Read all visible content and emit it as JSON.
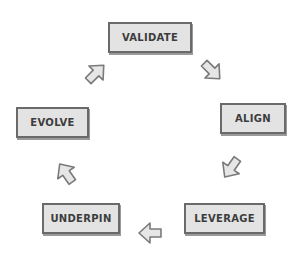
{
  "diagram": {
    "type": "cycle",
    "nodes": [
      {
        "id": "validate",
        "label": "VALIDATE"
      },
      {
        "id": "align",
        "label": "ALIGN"
      },
      {
        "id": "leverage",
        "label": "LEVERAGE"
      },
      {
        "id": "underpin",
        "label": "UNDERPIN"
      },
      {
        "id": "evolve",
        "label": "EVOLVE"
      }
    ],
    "edges": [
      {
        "from": "validate",
        "to": "align",
        "icon": "arrow-down-right-icon"
      },
      {
        "from": "align",
        "to": "leverage",
        "icon": "arrow-down-left-icon"
      },
      {
        "from": "leverage",
        "to": "underpin",
        "icon": "arrow-left-icon"
      },
      {
        "from": "underpin",
        "to": "evolve",
        "icon": "arrow-up-left-icon"
      },
      {
        "from": "evolve",
        "to": "validate",
        "icon": "arrow-up-right-icon"
      }
    ],
    "colors": {
      "box_fill": "#e3e3e3",
      "box_border": "#6a6a6a",
      "text": "#3c3c3c",
      "arrow_fill": "#e6e6e6",
      "arrow_stroke": "#7a7a7a"
    }
  }
}
